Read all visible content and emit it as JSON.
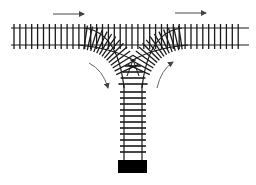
{
  "diagram": {
    "type": "railway-wye-junction",
    "colors": {
      "background": "#ffffff",
      "track": "#1a1a1a",
      "arrow": "#555555",
      "bumper": "#000000"
    },
    "main_line": {
      "direction": "left-to-right",
      "arrows": 2
    },
    "curved_arrows": [
      {
        "position": "left",
        "direction": "down-into-spur"
      },
      {
        "position": "right",
        "direction": "up-out-of-spur"
      }
    ],
    "spur": {
      "terminus": "bumper-block"
    }
  }
}
